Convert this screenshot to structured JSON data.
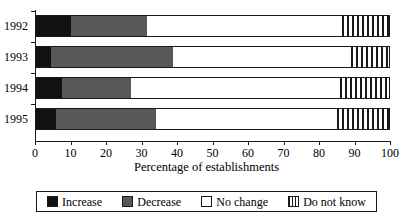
{
  "chart_data": {
    "type": "bar",
    "orientation": "horizontal",
    "stacked": true,
    "stack_mode": "percent",
    "title": "",
    "xlabel": "Percentage of establishments",
    "ylabel": "",
    "xlim": [
      0,
      100
    ],
    "xticks": [
      0,
      10,
      20,
      30,
      40,
      50,
      60,
      70,
      80,
      90,
      100
    ],
    "xtick_labels": [
      "0",
      "10",
      "20",
      "30",
      "40",
      "50",
      "60",
      "70",
      "80",
      "90",
      "100"
    ],
    "grid": false,
    "legend_position": "bottom",
    "categories": [
      "1992",
      "1993",
      "1994",
      "1995"
    ],
    "series": [
      {
        "name": "Increase",
        "color": "#111111",
        "values": [
          10.0,
          4.5,
          7.5,
          6.0
        ]
      },
      {
        "name": "Decrease",
        "color": "#585858",
        "values": [
          21.5,
          34.5,
          19.5,
          28.0
        ]
      },
      {
        "name": "No change",
        "color": "#ffffff",
        "values": [
          55.0,
          50.0,
          59.0,
          51.0
        ]
      },
      {
        "name": "Do not know",
        "color": "#ffffff",
        "pattern": "vertical-stripes",
        "values": [
          13.5,
          11.0,
          14.0,
          15.0
        ]
      }
    ],
    "cumulative_boundaries": [
      [
        10.0,
        31.5,
        86.5,
        100.0
      ],
      [
        4.5,
        39.0,
        89.0,
        100.0
      ],
      [
        7.5,
        27.0,
        86.0,
        100.0
      ],
      [
        6.0,
        34.0,
        85.0,
        100.0
      ]
    ]
  },
  "legend": {
    "items": [
      {
        "label": "Increase",
        "swatch": "increase"
      },
      {
        "label": "Decrease",
        "swatch": "decrease"
      },
      {
        "label": "No change",
        "swatch": "nochange"
      },
      {
        "label": "Do not know",
        "swatch": "donotknow"
      }
    ]
  }
}
